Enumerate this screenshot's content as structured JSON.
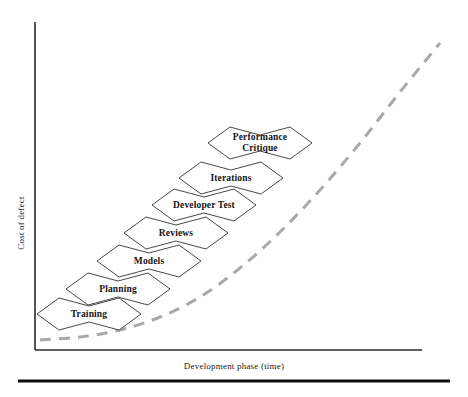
{
  "figure": {
    "background_color": "#ffffff",
    "axes": {
      "y_label": "Cost of defect",
      "x_label": "Development phase (time)",
      "axis_color": "#2b2b2b",
      "origin": {
        "x": 35,
        "y": 350
      },
      "x_end": 422,
      "y_top": 22
    },
    "curve": {
      "name": "cost-of-defect-trend",
      "style": "dashed",
      "color": "#a9a9a9",
      "stroke_width": 3,
      "dash_pattern": "11 8",
      "points": [
        {
          "x": 40,
          "y": 340
        },
        {
          "x": 80,
          "y": 337
        },
        {
          "x": 120,
          "y": 330
        },
        {
          "x": 160,
          "y": 317
        },
        {
          "x": 200,
          "y": 297
        },
        {
          "x": 240,
          "y": 268
        },
        {
          "x": 280,
          "y": 232
        },
        {
          "x": 320,
          "y": 190
        },
        {
          "x": 360,
          "y": 143
        },
        {
          "x": 400,
          "y": 92
        },
        {
          "x": 440,
          "y": 43
        }
      ]
    },
    "hexagons": {
      "fill": "#ffffff",
      "stroke": "#333333",
      "stroke_width": 0.9,
      "width": 104,
      "height": 32,
      "tip_inset": 22,
      "peak_rise": 8
    },
    "bottom_rule": {
      "color": "#0d0d0d",
      "thickness": 3,
      "x_start": 18,
      "x_end": 450,
      "y": 381
    }
  },
  "chart_data": {
    "type": "diagram",
    "title": "",
    "xlabel": "Development phase (time)",
    "ylabel": "Cost of defect",
    "grid": false,
    "legend": "none",
    "categories": [
      "Training",
      "Planning",
      "Models",
      "Reviews",
      "Developer Test",
      "Iterations",
      "Performance Critique"
    ],
    "nodes": [
      {
        "label": "Training",
        "display": "Training",
        "cx": 89,
        "cy": 314,
        "order": 1
      },
      {
        "label": "Planning",
        "display": "Planning",
        "cx": 118,
        "cy": 289,
        "order": 2
      },
      {
        "label": "Models",
        "display": "Models",
        "cx": 149,
        "cy": 261,
        "order": 3
      },
      {
        "label": "Reviews",
        "display": "Reviews",
        "cx": 176,
        "cy": 233,
        "order": 4
      },
      {
        "label": "Developer Test",
        "display": "Developer Test",
        "cx": 204,
        "cy": 205,
        "order": 5
      },
      {
        "label": "Iterations",
        "display": "Iterations",
        "cx": 231,
        "cy": 178,
        "order": 6
      },
      {
        "label": "Performance Critique",
        "display": "Performance\nCritique",
        "cx": 260,
        "cy": 143,
        "order": 7
      }
    ]
  }
}
